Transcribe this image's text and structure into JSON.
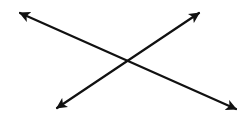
{
  "diagram": {
    "background": "#ffffff",
    "stroke_color": "#111111",
    "stroke_width": 2.2,
    "lines": [
      {
        "name": "line-descending",
        "start": [
          20,
          13
        ],
        "end": [
          236,
          109
        ],
        "arrowheads": [
          "start",
          "end"
        ]
      },
      {
        "name": "line-ascending",
        "start": [
          57,
          108
        ],
        "end": [
          199,
          13
        ],
        "arrowheads": [
          "start",
          "end"
        ]
      }
    ],
    "intersection": [
      128,
      60
    ]
  }
}
